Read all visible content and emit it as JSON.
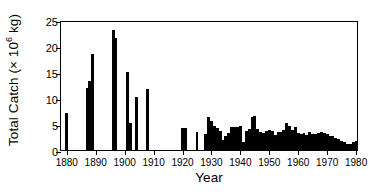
{
  "chart_data": {
    "type": "bar",
    "title": "",
    "xlabel": "Year",
    "ylabel": "Total Catch (× 10⁶ kg)",
    "ylabel_prefix": "Total Catch (× 10",
    "ylabel_exponent": "6",
    "ylabel_suffix": " kg)",
    "xlim": [
      1878,
      1981
    ],
    "ylim": [
      0,
      25
    ],
    "grid": false,
    "legend": null,
    "yticks": [
      0,
      5,
      10,
      15,
      20,
      25
    ],
    "ytick_labels": [
      "0",
      "5",
      "10",
      "15",
      "20",
      "25"
    ],
    "xticks": [
      1880,
      1890,
      1900,
      1910,
      1920,
      1930,
      1940,
      1950,
      1960,
      1970,
      1980
    ],
    "xtick_labels": [
      "1880",
      "1890",
      "1900",
      "1910",
      "1920",
      "1930",
      "1940",
      "1950",
      "1960",
      "1970",
      "1980"
    ],
    "bar_color": "#000000",
    "categories": [
      1880,
      1887,
      1888,
      1889,
      1896,
      1897,
      1901,
      1902,
      1904,
      1908,
      1920,
      1921,
      1925,
      1928,
      1929,
      1930,
      1931,
      1932,
      1933,
      1934,
      1935,
      1936,
      1937,
      1938,
      1939,
      1940,
      1941,
      1942,
      1943,
      1944,
      1945,
      1946,
      1947,
      1948,
      1949,
      1950,
      1951,
      1952,
      1953,
      1954,
      1955,
      1956,
      1957,
      1958,
      1959,
      1960,
      1961,
      1962,
      1963,
      1964,
      1965,
      1966,
      1967,
      1968,
      1969,
      1970,
      1971,
      1972,
      1973,
      1974,
      1975,
      1976,
      1977,
      1978,
      1979,
      1980
    ],
    "values": [
      7.1,
      12.0,
      13.3,
      18.4,
      23.0,
      21.5,
      15.0,
      5.2,
      10.1,
      11.8,
      4.2,
      4.2,
      3.5,
      3.0,
      6.4,
      5.6,
      4.6,
      4.3,
      3.6,
      2.0,
      2.6,
      3.2,
      4.4,
      4.5,
      4.4,
      4.6,
      1.5,
      3.7,
      4.1,
      6.4,
      6.6,
      4.0,
      3.5,
      3.2,
      3.6,
      3.9,
      3.7,
      2.9,
      3.4,
      3.5,
      3.8,
      5.1,
      4.7,
      3.9,
      4.4,
      3.2,
      3.0,
      3.3,
      2.9,
      3.4,
      3.0,
      3.1,
      3.3,
      3.4,
      3.3,
      3.0,
      2.7,
      2.7,
      2.4,
      2.2,
      1.8,
      1.5,
      1.2,
      1.1,
      1.5,
      1.8
    ]
  }
}
